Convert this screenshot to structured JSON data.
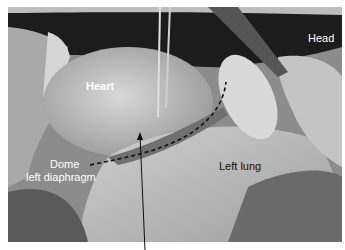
{
  "figure": {
    "labels": {
      "head": "Head",
      "heart": "Heart",
      "dome_line1": "Dome",
      "dome_line2": "left diaphragm",
      "left_lung": "Left lung"
    },
    "annotations": {
      "dashed_line": "dashed curve over structure",
      "arrow": "arrow pointing up from bottom to structure"
    }
  }
}
